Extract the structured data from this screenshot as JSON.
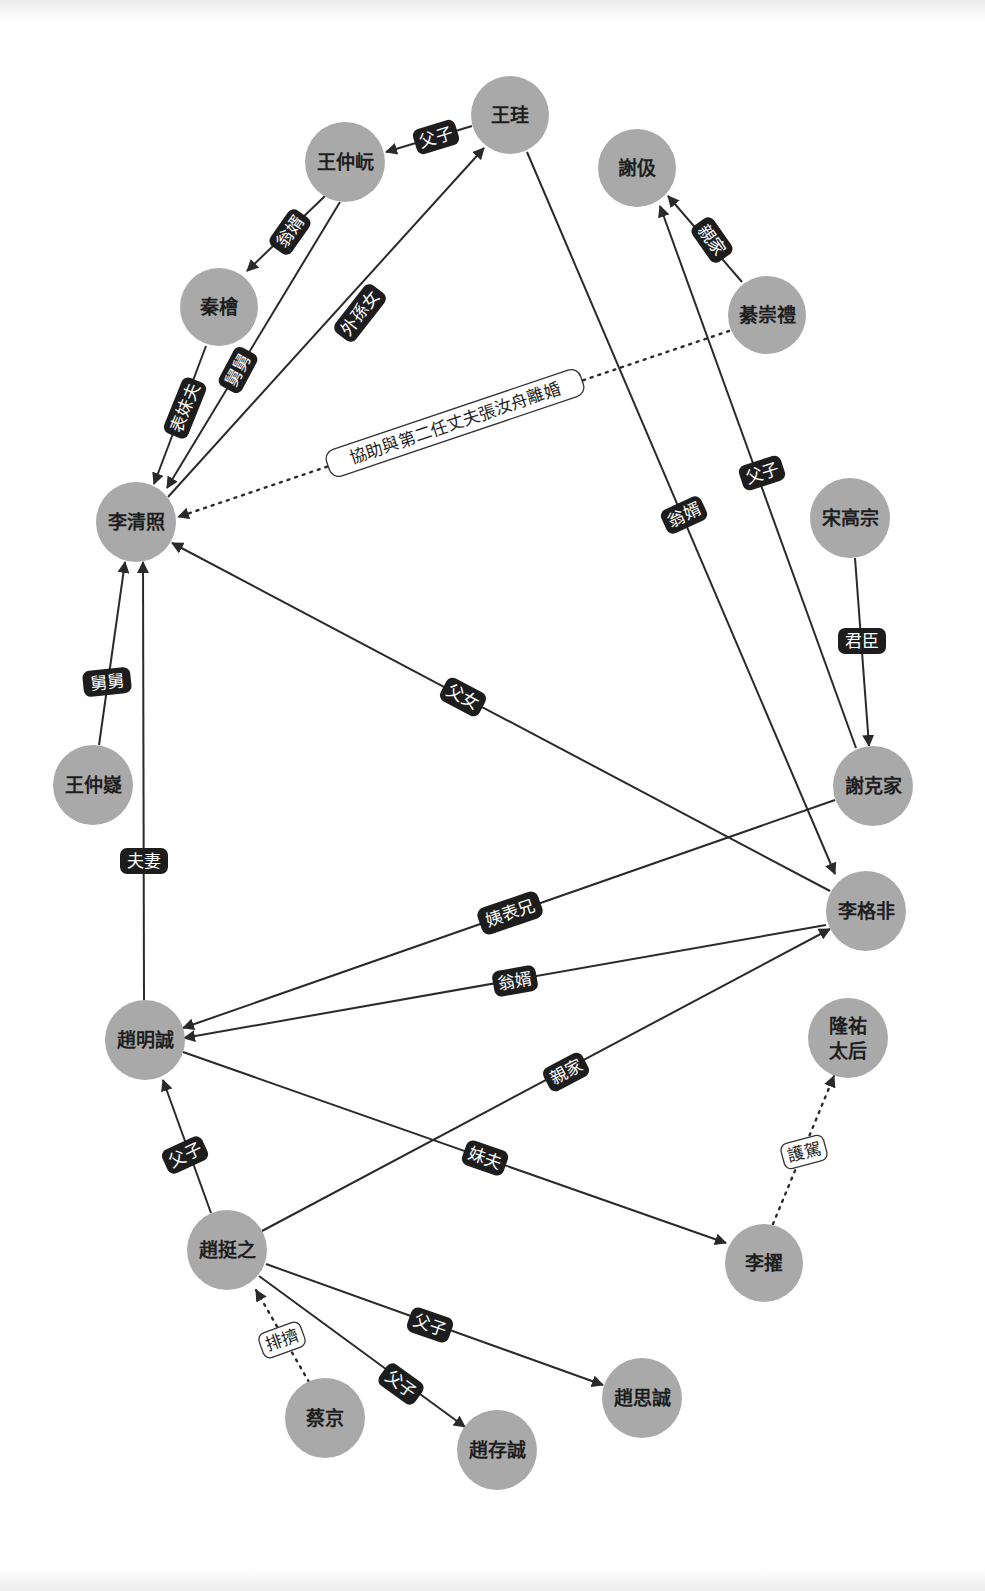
{
  "diagram": {
    "type": "relationship-graph",
    "colors": {
      "node_fill": "#a9a9a9",
      "node_text": "#1e1e1e",
      "edge": "#2a2a2a",
      "label_bg": "#1d1d1d",
      "label_text": "#ffffff",
      "dotted_label_bg": "#ffffff"
    },
    "nodes": [
      {
        "id": "wanggui",
        "label": "王珪",
        "x": 510,
        "y": 115
      },
      {
        "id": "wangzhongyi1",
        "label": "王仲岏",
        "x": 345,
        "y": 162
      },
      {
        "id": "xieji",
        "label": "謝伋",
        "x": 637,
        "y": 168
      },
      {
        "id": "qinhui",
        "label": "秦檜",
        "x": 219,
        "y": 307
      },
      {
        "id": "qichongli",
        "label": "綦崇禮",
        "x": 767,
        "y": 315
      },
      {
        "id": "liqingzhao",
        "label": "李清照",
        "x": 136,
        "y": 522
      },
      {
        "id": "songgaozong",
        "label": "宋高宗",
        "x": 850,
        "y": 518
      },
      {
        "id": "wangzhongyi2",
        "label": "王仲嶷",
        "x": 93,
        "y": 785
      },
      {
        "id": "xiekejia",
        "label": "謝克家",
        "x": 873,
        "y": 786
      },
      {
        "id": "ligefei",
        "label": "李格非",
        "x": 866,
        "y": 911
      },
      {
        "id": "zhaomingcheng",
        "label": "趙明誠",
        "x": 145,
        "y": 1040
      },
      {
        "id": "longyou",
        "label": "隆祐太后",
        "line1": "隆祐",
        "line2": "太后",
        "x": 848,
        "y": 1038
      },
      {
        "id": "zhaotingzhi",
        "label": "趙挺之",
        "x": 227,
        "y": 1250
      },
      {
        "id": "lizhuo",
        "label": "李擢",
        "x": 764,
        "y": 1263
      },
      {
        "id": "caijing",
        "label": "蔡京",
        "x": 325,
        "y": 1418
      },
      {
        "id": "zhaosicheng",
        "label": "趙思誠",
        "x": 642,
        "y": 1398
      },
      {
        "id": "zhaocuncheng",
        "label": "趙存誠",
        "x": 497,
        "y": 1450
      }
    ],
    "edges": [
      {
        "from": "王珪",
        "to": "王仲岏",
        "label": "父子",
        "style": "solid"
      },
      {
        "from": "王仲岏",
        "to": "秦檜",
        "label": "翁婿",
        "style": "solid"
      },
      {
        "from": "王仲岏",
        "to": "李清照",
        "label": "舅舅",
        "style": "solid"
      },
      {
        "from": "秦檜",
        "to": "李清照",
        "label": "表妹夫",
        "style": "solid"
      },
      {
        "from": "李清照",
        "to": "王珪",
        "label": "外孫女",
        "style": "solid"
      },
      {
        "from": "綦崇禮",
        "to": "謝伋",
        "label": "親家",
        "style": "solid"
      },
      {
        "from": "綦崇禮",
        "to": "李清照",
        "label": "協助與第二任丈夫張汝舟離婚",
        "style": "dotted"
      },
      {
        "from": "王珪",
        "to": "李格非",
        "label": "翁婿",
        "style": "solid"
      },
      {
        "from": "謝克家",
        "to": "謝伋",
        "label": "父子",
        "style": "solid"
      },
      {
        "from": "宋高宗",
        "to": "謝克家",
        "label": "君臣",
        "style": "solid"
      },
      {
        "from": "李格非",
        "to": "李清照",
        "label": "父女",
        "style": "solid"
      },
      {
        "from": "王仲嶷",
        "to": "李清照",
        "label": "舅舅",
        "style": "solid"
      },
      {
        "from": "趙明誠",
        "to": "李清照",
        "label": "夫妻",
        "style": "solid"
      },
      {
        "from": "謝克家",
        "to": "趙明誠",
        "label": "姨表兄",
        "style": "solid"
      },
      {
        "from": "李格非",
        "to": "趙明誠",
        "label": "翁婿",
        "style": "solid"
      },
      {
        "from": "趙挺之",
        "to": "李格非",
        "label": "親家",
        "style": "solid"
      },
      {
        "from": "趙明誠",
        "to": "李擢",
        "label": "妹夫",
        "style": "solid"
      },
      {
        "from": "李擢",
        "to": "隆祐太后",
        "label": "護駕",
        "style": "dotted"
      },
      {
        "from": "趙挺之",
        "to": "趙明誠",
        "label": "父子",
        "style": "solid"
      },
      {
        "from": "蔡京",
        "to": "趙挺之",
        "label": "排擠",
        "style": "dotted"
      },
      {
        "from": "趙挺之",
        "to": "趙思誠",
        "label": "父子",
        "style": "solid"
      },
      {
        "from": "趙挺之",
        "to": "趙存誠",
        "label": "父子",
        "style": "solid"
      }
    ]
  }
}
